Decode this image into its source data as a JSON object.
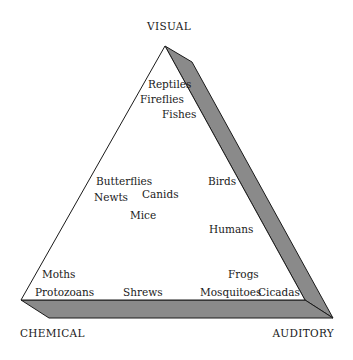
{
  "diagram": {
    "type": "ternary-triangle",
    "colors": {
      "shadow": "#8a8a8a",
      "outline": "#1a1a1a",
      "face": "#ffffff"
    },
    "vertices": {
      "top": "VISUAL",
      "bottom_left": "CHEMICAL",
      "bottom_right": "AUDITORY"
    },
    "items": [
      "Reptiles",
      "Fireflies",
      "Fishes",
      "Butterflies",
      "Newts",
      "Canids",
      "Mice",
      "Birds",
      "Humans",
      "Moths",
      "Protozoans",
      "Shrews",
      "Frogs",
      "Mosquitoes",
      "Cicadas"
    ]
  }
}
